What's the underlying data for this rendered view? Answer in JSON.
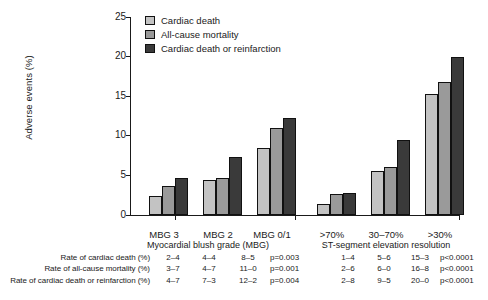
{
  "chart_data": {
    "type": "bar",
    "title": "",
    "xlabel": "",
    "ylabel": "Adverse events (%)",
    "ylim": [
      0,
      25
    ],
    "yticks": [
      0,
      5,
      10,
      15,
      20,
      25
    ],
    "grid": false,
    "legend_position": "top-left",
    "categories": [
      "MBG 3",
      "MBG 2",
      "MBG 0/1",
      ">70%",
      "30–70%",
      ">30%"
    ],
    "group_titles": [
      "Myocardial blush grade (MBG)",
      "ST-segment elevation resolution"
    ],
    "series": [
      {
        "name": "Cardiac death",
        "color": "#c3c3c3",
        "values": [
          2.4,
          4.4,
          8.5,
          1.4,
          5.6,
          15.3
        ]
      },
      {
        "name": "All-cause mortality",
        "color": "#9a9a9a",
        "values": [
          3.7,
          4.7,
          11.0,
          2.6,
          6.0,
          16.8
        ]
      },
      {
        "name": "Cardiac death or reinfarction",
        "color": "#3a3a3a",
        "values": [
          4.7,
          7.3,
          12.2,
          2.8,
          9.5,
          20.0
        ]
      }
    ]
  },
  "legend": {
    "items": [
      {
        "label": "Cardiac death"
      },
      {
        "label": "All-cause mortality"
      },
      {
        "label": "Cardiac death or reinfarction"
      }
    ]
  },
  "axis": {
    "y_title": "Adverse events (%)",
    "y_ticks": [
      "25",
      "20",
      "15",
      "10",
      "5",
      "0"
    ]
  },
  "groups": {
    "left": {
      "title": "Myocardial blush grade (MBG)",
      "categories": [
        "MBG 3",
        "MBG 2",
        "MBG 0/1"
      ]
    },
    "right": {
      "title": "ST-segment elevation resolution",
      "categories": [
        ">70%",
        "30–70%",
        ">30%"
      ]
    }
  },
  "table": {
    "rows": [
      {
        "label": "Rate of cardiac death (%)",
        "values": [
          "2–4",
          "4–4",
          "8–5",
          "1–4",
          "5–6",
          "15–3"
        ],
        "p_left": "p=0.003",
        "p_right": "p<0.0001"
      },
      {
        "label": "Rate of all-cause mortality (%)",
        "values": [
          "3–7",
          "4–7",
          "11–0",
          "2–6",
          "6–0",
          "16–8"
        ],
        "p_left": "p=0.001",
        "p_right": "p<0.0001"
      },
      {
        "label": "Rate of cardiac death or reinfarction (%)",
        "values": [
          "4–7",
          "7–3",
          "12–2",
          "2–8",
          "9–5",
          "20–0"
        ],
        "p_left": "p=0.004",
        "p_right": "p<0.0001"
      }
    ]
  }
}
